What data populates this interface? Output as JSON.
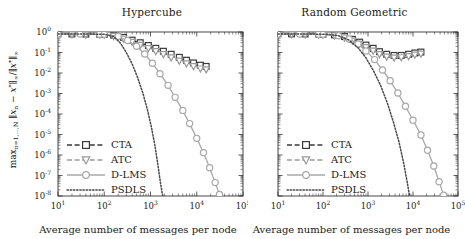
{
  "figure": {
    "panels": [
      {
        "id": "hypercube",
        "title": "Hypercube",
        "xlabel": "Average number of messages per node",
        "ylabel_plain": "max n=1,...,N ||x_n - x*||inf / ||x*||inf"
      },
      {
        "id": "random-geometric",
        "title": "Random Geometric",
        "xlabel": "Average number of messages per node",
        "ylabel_plain": "max n=1,...,N ||x_n - x*||inf / ||x*||inf"
      }
    ],
    "legend_entries": [
      {
        "label": "CTA",
        "marker": "square",
        "line": "dashed",
        "color": "#3a3a3a"
      },
      {
        "label": "ATC",
        "marker": "triangle-down",
        "line": "dashed",
        "color": "#9a9a9a"
      },
      {
        "label": "D-LMS",
        "marker": "circle",
        "line": "solid",
        "color": "#a8a8a8"
      },
      {
        "label": "PSDLS",
        "marker": "none",
        "line": "dotted",
        "color": "#4a4a4a"
      }
    ],
    "xticklabels": [
      "10",
      "10",
      "10",
      "10",
      "10"
    ],
    "xtickexponents": [
      "1",
      "2",
      "3",
      "4",
      "5"
    ],
    "yticklabels": [
      "10",
      "10",
      "10",
      "10",
      "10",
      "10",
      "10",
      "10",
      "10"
    ],
    "ytickexponents": [
      "0",
      "-1",
      "-2",
      "-3",
      "-4",
      "-5",
      "-6",
      "-7",
      "-8"
    ]
  },
  "chart_data": [
    {
      "type": "line",
      "title": "Hypercube",
      "xlabel": "Average number of messages per node",
      "ylabel": "max_{n=1,...,N} ||x_n - x*||_inf / ||x*||_inf",
      "xscale": "log",
      "yscale": "log",
      "xlim": [
        10,
        100000
      ],
      "ylim": [
        1e-08,
        1
      ],
      "grid": false,
      "legend_position": "lower-left",
      "series": [
        {
          "name": "CTA",
          "marker": "square",
          "linestyle": "dashed",
          "color": "#3a3a3a",
          "x": [
            10,
            20,
            40,
            80,
            100,
            160,
            260,
            400,
            600,
            900,
            1300,
            1900,
            2800,
            4200,
            6000,
            8500,
            12000,
            16000
          ],
          "y": [
            0.82,
            0.8,
            0.79,
            0.78,
            0.77,
            0.7,
            0.55,
            0.4,
            0.3,
            0.22,
            0.16,
            0.115,
            0.082,
            0.058,
            0.042,
            0.031,
            0.024,
            0.021
          ]
        },
        {
          "name": "ATC",
          "marker": "triangle-down",
          "linestyle": "dashed",
          "color": "#9a9a9a",
          "x": [
            10,
            20,
            40,
            80,
            100,
            160,
            260,
            400,
            600,
            900,
            1300,
            1900,
            2800,
            4200,
            6000,
            8500,
            12000,
            16000
          ],
          "y": [
            0.8,
            0.78,
            0.77,
            0.76,
            0.75,
            0.66,
            0.49,
            0.34,
            0.24,
            0.17,
            0.12,
            0.085,
            0.059,
            0.041,
            0.03,
            0.022,
            0.017,
            0.0155
          ]
        },
        {
          "name": "D-LMS",
          "marker": "circle",
          "linestyle": "solid",
          "color": "#a8a8a8",
          "x": [
            10,
            30,
            80,
            100,
            200,
            320,
            500,
            750,
            1100,
            1600,
            2400,
            3400,
            5000,
            7000,
            10000,
            14000,
            19000,
            25000,
            31000,
            36000
          ],
          "y": [
            0.8,
            0.79,
            0.78,
            0.77,
            0.62,
            0.38,
            0.2,
            0.085,
            0.03,
            0.0092,
            0.0025,
            0.00065,
            0.00015,
            3.4e-05,
            6.5e-06,
            1.3e-06,
            2.4e-07,
            4.5e-08,
            1.2e-08,
            6e-09
          ]
        },
        {
          "name": "PSDLS",
          "marker": "none",
          "linestyle": "dotted",
          "color": "#4a4a4a",
          "x": [
            10,
            50,
            100,
            160,
            220,
            300,
            400,
            520,
            680,
            860,
            1050,
            1250,
            1450,
            1650,
            1850,
            2000
          ],
          "y": [
            0.8,
            0.79,
            0.78,
            0.6,
            0.3,
            0.1,
            0.028,
            0.0065,
            0.0011,
            0.00016,
            2.2e-05,
            2.8e-06,
            3.2e-07,
            4e-08,
            9e-09,
            5e-09
          ]
        }
      ]
    },
    {
      "type": "line",
      "title": "Random Geometric",
      "xlabel": "Average number of messages per node",
      "ylabel": "max_{n=1,...,N} ||x_n - x*||_inf / ||x*||_inf",
      "xscale": "log",
      "yscale": "log",
      "xlim": [
        10,
        100000
      ],
      "ylim": [
        1e-08,
        1
      ],
      "grid": false,
      "legend_position": "lower-left",
      "series": [
        {
          "name": "CTA",
          "marker": "square",
          "linestyle": "dashed",
          "color": "#3a3a3a",
          "x": [
            10,
            20,
            40,
            80,
            100,
            180,
            300,
            450,
            650,
            900,
            1300,
            1800,
            2600,
            3800,
            5500,
            8000,
            11000,
            15000
          ],
          "y": [
            0.82,
            0.81,
            0.8,
            0.79,
            0.78,
            0.72,
            0.6,
            0.44,
            0.32,
            0.23,
            0.16,
            0.11,
            0.082,
            0.072,
            0.072,
            0.082,
            0.095,
            0.105
          ]
        },
        {
          "name": "ATC",
          "marker": "triangle-down",
          "linestyle": "dashed",
          "color": "#9a9a9a",
          "x": [
            10,
            20,
            40,
            80,
            100,
            180,
            300,
            450,
            650,
            900,
            1300,
            1800,
            2600,
            3800,
            5500,
            8000,
            11000,
            15000
          ],
          "y": [
            0.8,
            0.79,
            0.78,
            0.77,
            0.76,
            0.69,
            0.55,
            0.39,
            0.27,
            0.185,
            0.125,
            0.086,
            0.065,
            0.058,
            0.06,
            0.068,
            0.08,
            0.09
          ]
        },
        {
          "name": "D-LMS",
          "marker": "circle",
          "linestyle": "solid",
          "color": "#a8a8a8",
          "x": [
            10,
            30,
            80,
            100,
            220,
            380,
            600,
            900,
            1400,
            2100,
            3100,
            4600,
            6800,
            10000,
            15000,
            21000,
            29000,
            38000,
            48000,
            58000,
            66000
          ],
          "y": [
            0.8,
            0.79,
            0.78,
            0.77,
            0.66,
            0.45,
            0.26,
            0.12,
            0.045,
            0.014,
            0.0042,
            0.00105,
            0.00024,
            5e-05,
            9.5e-06,
            1.7e-06,
            2.9e-07,
            5e-08,
            1.1e-08,
            5e-09,
            3e-09
          ]
        },
        {
          "name": "PSDLS",
          "marker": "none",
          "linestyle": "dotted",
          "color": "#4a4a4a",
          "x": [
            10,
            60,
            120,
            220,
            380,
            600,
            900,
            1300,
            1900,
            2700,
            3700,
            4900,
            6200,
            7400,
            8400,
            9200,
            9800
          ],
          "y": [
            0.8,
            0.79,
            0.78,
            0.66,
            0.4,
            0.17,
            0.055,
            0.014,
            0.0025,
            0.00034,
            3.8e-05,
            4.2e-06,
            4e-07,
            5e-08,
            1e-08,
            4e-09,
            3e-09
          ]
        }
      ]
    }
  ]
}
